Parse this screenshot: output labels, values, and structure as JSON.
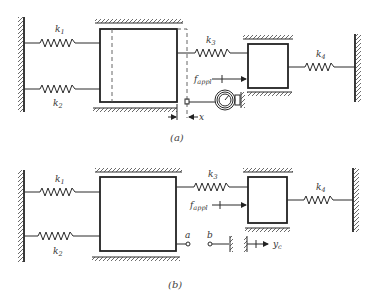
{
  "figure": {
    "panel_a": {
      "caption": "(a)",
      "springs": [
        {
          "label": "k",
          "sub": "1"
        },
        {
          "label": "k",
          "sub": "2"
        },
        {
          "label": "k",
          "sub": "3"
        },
        {
          "label": "k",
          "sub": "4"
        }
      ],
      "force_label": "f",
      "force_sub": "appl",
      "displacement_label": "x",
      "instrument": "dial-gauge"
    },
    "panel_b": {
      "caption": "(b)",
      "springs": [
        {
          "label": "k",
          "sub": "1"
        },
        {
          "label": "k",
          "sub": "2"
        },
        {
          "label": "k",
          "sub": "3"
        },
        {
          "label": "k",
          "sub": "4"
        }
      ],
      "force_label": "f",
      "force_sub": "appl",
      "terminal_a": "a",
      "terminal_b": "b",
      "output_label": "y",
      "output_sub": "c"
    }
  }
}
